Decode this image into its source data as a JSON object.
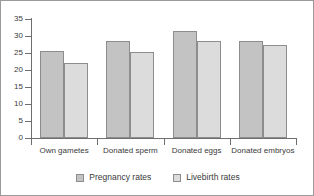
{
  "chart_data": {
    "type": "bar",
    "title": "",
    "subtitle": "",
    "xlabel": "",
    "ylabel": "",
    "categories": [
      "Own gametes",
      "Donated sperm",
      "Donated eggs",
      "Donated embryos"
    ],
    "series": [
      {
        "name": "Pregnancy rates",
        "values": [
          25.5,
          28.6,
          31.5,
          28.4
        ],
        "color": "#c3c3c3"
      },
      {
        "name": "Livebirth rates",
        "values": [
          22.2,
          25.2,
          28.5,
          27.3
        ],
        "color": "#dcdcdc"
      }
    ],
    "ylim": [
      0,
      35
    ],
    "yticks": [
      0,
      5,
      10,
      15,
      20,
      25,
      30,
      35
    ],
    "ytick_labels": [
      "0",
      "5",
      "10",
      "15",
      "20",
      "25",
      "30",
      "35"
    ],
    "grid": false,
    "legend_position": "bottom"
  },
  "legend": {
    "items": [
      {
        "label": "Pregnancy rates",
        "swatch": "pregnancy"
      },
      {
        "label": "Livebirth rates",
        "swatch": "livebirth"
      }
    ]
  }
}
